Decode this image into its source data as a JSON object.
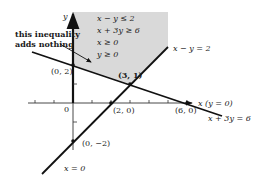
{
  "diagram": {
    "type": "feasible-region-plot",
    "colors": {
      "region_fill": "#d9d9d9",
      "line": "#111111",
      "text": "#1a1a1a"
    },
    "axes": {
      "x_label": "x (y = 0)",
      "y_label": "y",
      "origin_label": "0",
      "y_axis_line_label": "x = 0"
    },
    "constraints": [
      "x − y ≤ 2",
      "x + 3y ≥ 6",
      "x ≥ 0",
      "y ≥ 0"
    ],
    "lines": [
      {
        "label": "x − y = 2"
      },
      {
        "label": "x + 3y = 6"
      }
    ],
    "points": [
      {
        "label": "(0, 2)"
      },
      {
        "label": "(3, 1)"
      },
      {
        "label": "(2, 0)"
      },
      {
        "label": "(6, 0)"
      },
      {
        "label": "(0, −2)"
      }
    ],
    "annotation": {
      "line1": "this inequality",
      "line2": "adds nothing"
    }
  }
}
